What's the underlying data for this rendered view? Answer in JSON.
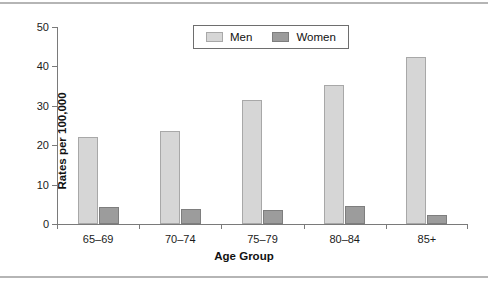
{
  "chart_data": {
    "type": "bar",
    "title": "",
    "xlabel": "Age Group",
    "ylabel": "Rates per 100,000",
    "categories": [
      "65–69",
      "70–74",
      "75–79",
      "80–84",
      "85+"
    ],
    "series": [
      {
        "name": "Men",
        "color": "#d6d6d6",
        "values": [
          22.0,
          23.5,
          31.5,
          35.3,
          42.5
        ]
      },
      {
        "name": "Women",
        "color": "#9c9c9c",
        "values": [
          4.4,
          3.7,
          3.5,
          4.5,
          2.4
        ]
      }
    ],
    "ylim": [
      0,
      50
    ],
    "yticks": [
      0,
      10,
      20,
      30,
      40,
      50
    ],
    "ytick_labels": [
      "0",
      "10",
      "20",
      "30",
      "40",
      "50"
    ],
    "grid": false,
    "legend_position": "top-center",
    "legend_entries": [
      "Men",
      "Women"
    ]
  },
  "figure": {
    "top_rule_color": "#b5b5b5",
    "bottom_rule_color": "#b5b5b5",
    "axis_color": "#7a7a7a",
    "background": "#ffffff"
  }
}
